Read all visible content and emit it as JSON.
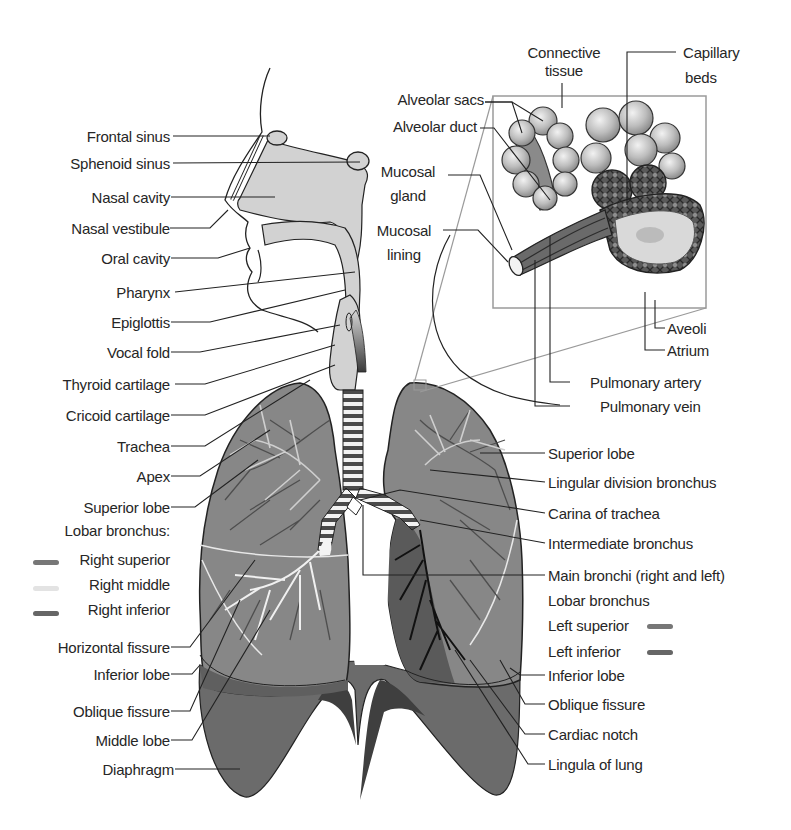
{
  "colors": {
    "lung_light": "#8a8a8a",
    "lung_dark": "#5e5e5e",
    "diaphragm": "#6a6a6a",
    "airway_fill": "#d2d2d2",
    "bronchi_white": "#e8e8e8",
    "line": "#222222",
    "inset_box": "#9a9a9a",
    "swatch_right_superior": "#777777",
    "swatch_right_middle": "#e3e3e3",
    "swatch_right_inferior": "#666666",
    "swatch_left_superior": "#777777",
    "swatch_left_inferior": "#666666"
  },
  "left_labels": {
    "frontal_sinus": "Frontal sinus",
    "sphenoid_sinus": "Sphenoid sinus",
    "nasal_cavity": "Nasal cavity",
    "nasal_vestibule": "Nasal vestibule",
    "oral_cavity": "Oral cavity",
    "pharynx": "Pharynx",
    "epiglottis": "Epiglottis",
    "vocal_fold": "Vocal fold",
    "thyroid_cartilage": "Thyroid cartilage",
    "cricoid_cartilage": "Cricoid cartilage",
    "trachea": "Trachea",
    "apex": "Apex",
    "superior_lobe": "Superior lobe",
    "lobar_bronchus": "Lobar bronchus:",
    "right_superior": "Right superior",
    "right_middle": "Right middle",
    "right_inferior": "Right inferior",
    "horizontal_fissure": "Horizontal fissure",
    "inferior_lobe": "Inferior lobe",
    "oblique_fissure": "Oblique fissure",
    "middle_lobe": "Middle lobe",
    "diaphragm": "Diaphragm"
  },
  "inset_labels": {
    "connective_tissue_1": "Connective",
    "connective_tissue_2": "tissue",
    "capillary_beds_1": "Capillary",
    "capillary_beds_2": "beds",
    "alveolar_sacs": "Alveolar sacs",
    "alveolar_duct": "Alveolar duct",
    "mucosal_gland_1": "Mucosal",
    "mucosal_gland_2": "gland",
    "mucosal_lining_1": "Mucosal",
    "mucosal_lining_2": "lining",
    "aveoli": "Aveoli",
    "atrium": "Atrium",
    "pulmonary_artery": "Pulmonary artery",
    "pulmonary_vein": "Pulmonary vein"
  },
  "right_labels": {
    "superior_lobe": "Superior lobe",
    "lingular_division_bronchus": "Lingular division bronchus",
    "carina_of_trachea": "Carina of trachea",
    "intermediate_bronchus": "Intermediate bronchus",
    "main_bronchi": "Main bronchi (right and left)",
    "lobar_bronchus": "Lobar bronchus",
    "left_superior": "Left superior",
    "left_inferior": "Left inferior",
    "inferior_lobe": "Inferior lobe",
    "oblique_fissure": "Oblique fissure",
    "cardiac_notch": "Cardiac notch",
    "lingula_of_lung": "Lingula of lung"
  }
}
